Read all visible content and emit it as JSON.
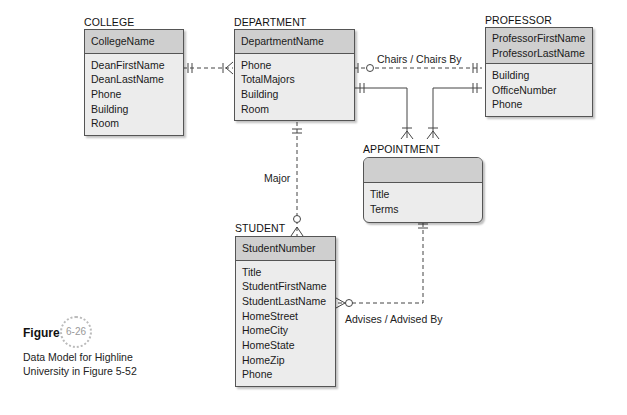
{
  "entities": {
    "college": {
      "name": "COLLEGE",
      "keys": [
        "CollegeName"
      ],
      "attributes": [
        "DeanFirstName",
        "DeanLastName",
        "Phone",
        "Building",
        "Room"
      ]
    },
    "department": {
      "name": "DEPARTMENT",
      "keys": [
        "DepartmentName"
      ],
      "attributes": [
        "Phone",
        "TotalMajors",
        "Building",
        "Room"
      ]
    },
    "professor": {
      "name": "PROFESSOR",
      "keys": [
        "ProfessorFirstName",
        "ProfessorLastName"
      ],
      "attributes": [
        "Building",
        "OfficeNumber",
        "Phone"
      ]
    },
    "appointment": {
      "name": "APPOINTMENT",
      "keys": [],
      "attributes": [
        "Title",
        "Terms"
      ]
    },
    "student": {
      "name": "STUDENT",
      "keys": [
        "StudentNumber"
      ],
      "attributes": [
        "Title",
        "StudentFirstName",
        "StudentLastName",
        "HomeStreet",
        "HomeCity",
        "HomeState",
        "HomeZip",
        "Phone"
      ]
    }
  },
  "relationships": {
    "chairs": "Chairs / Chairs By",
    "major": "Major",
    "advises": "Advises / Advised By"
  },
  "figure": {
    "label": "Figure",
    "number": "6-26",
    "caption_line1": "Data Model for Highline",
    "caption_line2": "University in Figure 5-52"
  }
}
